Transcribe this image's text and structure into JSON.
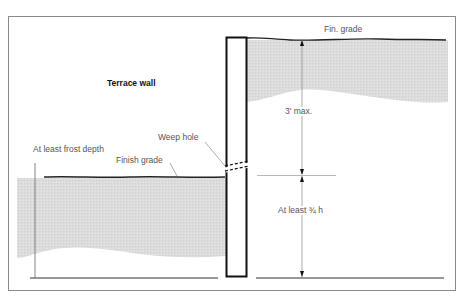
{
  "diagram": {
    "title": "Terrace wall",
    "labels": {
      "fin_grade_upper": "Fin. grade",
      "three_ft_max": "3' max.",
      "weep_hole": "Weep hole",
      "frost_depth": "At least frost depth",
      "finish_grade_lower": "Finish grade",
      "at_least_three_quarters_h": "At least ¾ h"
    },
    "colors": {
      "frame": "#8a8a8a",
      "wall_outline": "#111111",
      "soil_fill": "#d9d9d9",
      "leader_line": "#888888",
      "text": "#555555"
    }
  }
}
